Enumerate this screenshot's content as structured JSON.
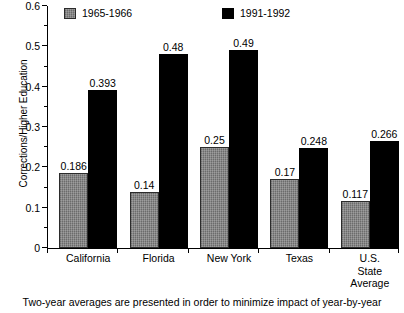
{
  "chart_data": {
    "type": "bar",
    "title": "",
    "xlabel": "",
    "ylabel": "Corrections/Higher Education",
    "ylim": [
      0,
      0.6
    ],
    "grid": false,
    "legend_position": "top-inside",
    "categories": [
      "California",
      "Florida",
      "New York",
      "Texas",
      "U.S.\nState\nAverage"
    ],
    "category_lines": [
      [
        "California"
      ],
      [
        "Florida"
      ],
      [
        "New York"
      ],
      [
        "Texas"
      ],
      [
        "U.S.",
        "State",
        "Average"
      ]
    ],
    "series": [
      {
        "name": "1965-1966",
        "color": "#7d7d7d",
        "values": [
          0.186,
          0.14,
          0.25,
          0.17,
          0.117
        ],
        "labels": [
          "0.186",
          "0.14",
          "0.25",
          "0.17",
          "0.117"
        ]
      },
      {
        "name": "1991-1992",
        "color": "#000000",
        "values": [
          0.393,
          0.48,
          0.49,
          0.248,
          0.266
        ],
        "labels": [
          "0.393",
          "0.48",
          "0.49",
          "0.248",
          "0.266"
        ]
      }
    ],
    "ytick_labels": [
      "0",
      "0.1",
      "0.2",
      "0.3",
      "0.4",
      "0.5",
      "0.6"
    ],
    "ytick_values": [
      0,
      0.1,
      0.2,
      0.3,
      0.4,
      0.5,
      0.6
    ],
    "yminor_values": [
      0.05,
      0.15,
      0.25,
      0.35,
      0.45,
      0.55
    ]
  },
  "legend": {
    "entries": [
      {
        "label": "1965-1966"
      },
      {
        "label": "1991-1992"
      }
    ]
  },
  "caption": {
    "text": "Two-year averages are presented in order to minimize impact of year-by-year"
  }
}
